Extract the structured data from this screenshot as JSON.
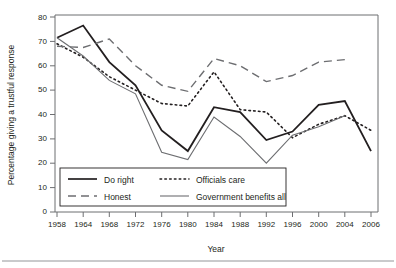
{
  "figure": {
    "background_color": "#ffffff",
    "ink_color": "#231f20",
    "axis_color": "#6d6e71"
  },
  "chart_data": {
    "type": "line",
    "title": "",
    "xlabel": "Year",
    "ylabel": "Percentage giving a trustful response",
    "categories": [
      "1958",
      "1964",
      "1968",
      "1972",
      "1976",
      "1980",
      "1984",
      "1988",
      "1992",
      "1996",
      "2000",
      "2004",
      "2006"
    ],
    "ylim": [
      0,
      80
    ],
    "yticks": [
      "0",
      "10",
      "20",
      "30",
      "40",
      "50",
      "60",
      "70",
      "80"
    ],
    "grid": false,
    "legend_position": "lower-left-inside",
    "series": [
      {
        "name": "Do right",
        "style": "solid-thick",
        "color": "#231f20",
        "values": [
          71.5,
          76.5,
          61.5,
          52.0,
          33.5,
          25.0,
          43.0,
          41.0,
          29.5,
          33.0,
          44.0,
          45.5,
          25.0
        ]
      },
      {
        "name": "Officials care",
        "style": "dotted",
        "color": "#231f20",
        "values": [
          69.0,
          63.5,
          55.5,
          50.0,
          44.5,
          43.5,
          57.5,
          42.0,
          41.0,
          30.5,
          36.0,
          39.5,
          33.5
        ]
      },
      {
        "name": "Honest",
        "style": "dashed",
        "color": "#6d6e71",
        "values": [
          68.0,
          67.5,
          71.0,
          60.0,
          52.0,
          49.5,
          63.0,
          60.0,
          53.5,
          56.0,
          61.5,
          62.5,
          null
        ]
      },
      {
        "name": "Government benefits all",
        "style": "solid-thin",
        "color": "#6d6e71",
        "values": [
          71.5,
          64.0,
          54.0,
          48.5,
          24.5,
          21.5,
          39.0,
          31.0,
          20.0,
          31.5,
          35.0,
          39.5,
          null
        ]
      }
    ]
  },
  "legend": {
    "entries": [
      {
        "label": "Do right"
      },
      {
        "label": "Officials care"
      },
      {
        "label": "Honest"
      },
      {
        "label": "Government benefits all"
      }
    ]
  }
}
